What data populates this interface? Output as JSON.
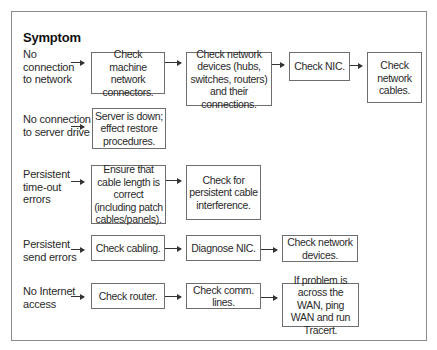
{
  "diagram": {
    "title": "Symptom",
    "rows": [
      {
        "symptom": "No connection to network",
        "steps": [
          "Check machine network connectors.",
          "Check network devices (hubs, switches, routers) and their connections.",
          "Check NIC.",
          "Check network cables."
        ]
      },
      {
        "symptom": "No connection to server drive",
        "steps": [
          "Server is down; effect restore procedures."
        ]
      },
      {
        "symptom": "Persistent time-out errors",
        "steps": [
          "Ensure that cable length is correct (including patch cables/panels).",
          "Check for persistent cable interference."
        ]
      },
      {
        "symptom": "Persistent send errors",
        "steps": [
          "Check cabling.",
          "Diagnose NIC.",
          "Check network devices."
        ]
      },
      {
        "symptom": "No Internet access",
        "steps": [
          "Check router.",
          "Check comm. lines.",
          "If problem is across the WAN, ping WAN and run Tracert."
        ]
      }
    ]
  }
}
